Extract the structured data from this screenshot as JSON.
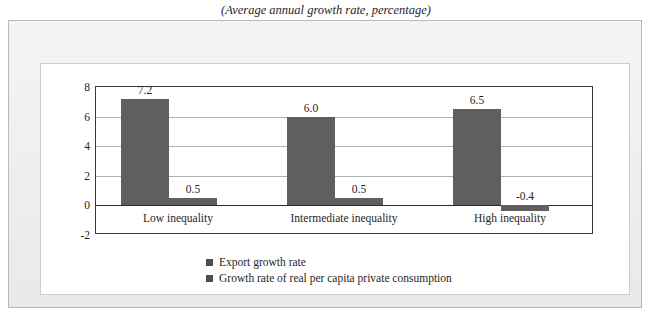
{
  "figure": {
    "caption": "(Average annual growth rate, percentage)"
  },
  "chart_data": {
    "type": "bar",
    "title": "(Average annual growth rate, percentage)",
    "xlabel": "",
    "ylabel": "Percentage",
    "ylim": [
      -2,
      8
    ],
    "yticks": [
      "8",
      "6",
      "4",
      "2",
      "0",
      "-2"
    ],
    "grid": "horizontal",
    "legend_position": "bottom-center",
    "categories": [
      "Low inequality",
      "Intermediate inequality",
      "High inequality"
    ],
    "series": [
      {
        "name": "Export growth rate",
        "color": "#5f5f5f",
        "values": [
          7.2,
          6.0,
          6.5
        ],
        "labels": [
          "7.2",
          "6.0",
          "6.5"
        ]
      },
      {
        "name": "Growth rate of real per capita private consumption",
        "color": "#5f5f5f",
        "values": [
          0.5,
          0.5,
          -0.4
        ],
        "labels": [
          "0.5",
          "0.5",
          "-0.4"
        ]
      }
    ]
  },
  "colors": {
    "bar": "#5f5f5f",
    "axis": "#3a3a3a",
    "grid": "#b0b0b0",
    "frame": "#f1f1f1",
    "panel": "#ffffff"
  }
}
